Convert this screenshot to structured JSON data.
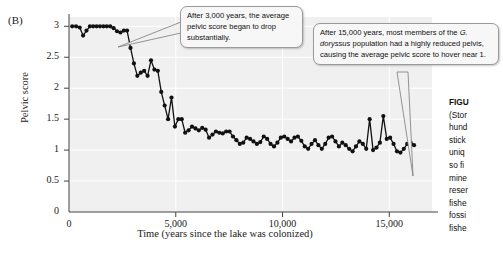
{
  "panel": {
    "label": "(B)"
  },
  "chart_data": {
    "type": "line",
    "title": "",
    "xlabel": "Time (years since the lake was colonized)",
    "ylabel": "Pelvic score",
    "xlim": [
      0,
      17000
    ],
    "ylim": [
      0,
      3.15
    ],
    "grid": true,
    "legend": "none",
    "marker": "filled-circle",
    "line_color": "#111111",
    "plot_background": "#f0f0f0",
    "xticks": [
      0,
      5000,
      10000,
      15000
    ],
    "xtick_labels": [
      "0",
      "5,000",
      "10,000",
      "15,000"
    ],
    "yticks": [
      0,
      0.5,
      1,
      1.5,
      2,
      2.5,
      3
    ],
    "ytick_labels": [
      "0",
      "0.5",
      "1",
      "1.5",
      "2",
      "2.5",
      "3"
    ],
    "series": [
      {
        "name": "Average pelvic score",
        "x": [
          150,
          330,
          500,
          660,
          820,
          980,
          1130,
          1290,
          1450,
          1610,
          1770,
          1930,
          2090,
          2250,
          2410,
          2570,
          2720,
          2880,
          3040,
          3200,
          3360,
          3520,
          3680,
          3840,
          4000,
          4160,
          4320,
          4480,
          4640,
          4800,
          4960,
          5120,
          5280,
          5440,
          5600,
          5760,
          5920,
          6080,
          6240,
          6400,
          6560,
          6720,
          6880,
          7040,
          7200,
          7360,
          7520,
          7680,
          7840,
          8000,
          8160,
          8320,
          8480,
          8640,
          8800,
          8960,
          9120,
          9280,
          9440,
          9600,
          9760,
          9920,
          10080,
          10240,
          10400,
          10560,
          10720,
          10880,
          11040,
          11200,
          11360,
          11520,
          11680,
          11840,
          12000,
          12160,
          12320,
          12480,
          12640,
          12800,
          12960,
          13120,
          13280,
          13440,
          13600,
          13760,
          13920,
          14080,
          14240,
          14400,
          14560,
          14720,
          14880,
          15040,
          15200,
          15360,
          15520,
          15680,
          15840,
          16000,
          16160
        ],
        "y": [
          3.0,
          3.0,
          2.98,
          2.85,
          2.93,
          3.0,
          3.0,
          3.0,
          3.0,
          3.0,
          3.0,
          3.0,
          2.97,
          2.92,
          2.9,
          2.93,
          2.93,
          2.65,
          2.4,
          2.2,
          2.25,
          2.28,
          2.2,
          2.45,
          2.3,
          2.28,
          1.94,
          1.72,
          1.5,
          1.85,
          1.38,
          1.5,
          1.5,
          1.28,
          1.32,
          1.38,
          1.35,
          1.32,
          1.36,
          1.33,
          1.2,
          1.25,
          1.3,
          1.28,
          1.27,
          1.3,
          1.3,
          1.22,
          1.16,
          1.1,
          1.12,
          1.2,
          1.18,
          1.14,
          1.1,
          1.13,
          1.22,
          1.18,
          1.1,
          1.06,
          1.12,
          1.2,
          1.22,
          1.18,
          1.14,
          1.2,
          1.22,
          1.15,
          1.06,
          1.02,
          1.1,
          1.16,
          1.08,
          1.02,
          1.1,
          1.2,
          1.22,
          1.14,
          1.06,
          1.12,
          1.08,
          1.02,
          0.98,
          1.06,
          1.14,
          1.1,
          1.02,
          1.5,
          1.0,
          1.04,
          1.12,
          1.55,
          1.18,
          1.2,
          1.1,
          0.98,
          0.96,
          1.02,
          1.1,
          1.12,
          1.08
        ]
      }
    ]
  },
  "callouts": [
    {
      "id": "callout-1",
      "text_before_italic": "After 3,000 years, the average pelvic score began to drop substantially.",
      "italic": "",
      "text_after_italic": ""
    },
    {
      "id": "callout-2",
      "text_before_italic": "After 15,000 years, most members of the ",
      "italic": "G. doryssus",
      "text_after_italic": " population had a highly reduced pelvis, causing the average pelvic score to hover near 1."
    }
  ],
  "caption": {
    "title": "FIGU",
    "lines": [
      "(Stor",
      "hund",
      "stick",
      "uniq",
      "so fi",
      "mine",
      "reser",
      "fishe",
      "fossi",
      "fishe"
    ]
  }
}
